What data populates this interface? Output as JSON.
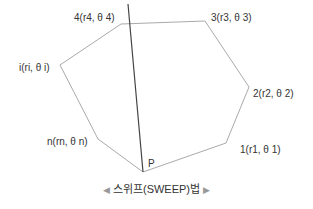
{
  "diagram": {
    "polygon_color": "#aaaaaa",
    "sweep_line_color": "#444444",
    "vertices": [
      {
        "id": "4",
        "label": "4(r4, θ 4)",
        "x": 121,
        "y": 24
      },
      {
        "id": "3",
        "label": "3(r3, θ 3)",
        "x": 205,
        "y": 21
      },
      {
        "id": "2",
        "label": "2(r2, θ 2)",
        "x": 249,
        "y": 87
      },
      {
        "id": "1",
        "label": "1(r1, θ 1)",
        "x": 226,
        "y": 143
      },
      {
        "id": "P",
        "label": "P",
        "x": 143,
        "y": 172
      },
      {
        "id": "n",
        "label": "n(rn, θ n)",
        "x": 98,
        "y": 139
      },
      {
        "id": "i",
        "label": "i(ri, θ i)",
        "x": 60,
        "y": 65
      }
    ],
    "sweep_line": {
      "x1": 128,
      "y1": 4,
      "x2": 143,
      "y2": 172
    }
  },
  "labels": {
    "v4": "4(r4, θ 4)",
    "v3": "3(r3, θ 3)",
    "v2": "2(r2, θ 2)",
    "v1": "1(r1, θ 1)",
    "vP": "P",
    "vn": "n(rn, θ n)",
    "vi": "i(ri, θ i)"
  },
  "caption": {
    "left_mark": "◀",
    "text": "스위프(SWEEP)법",
    "right_mark": "▶"
  }
}
